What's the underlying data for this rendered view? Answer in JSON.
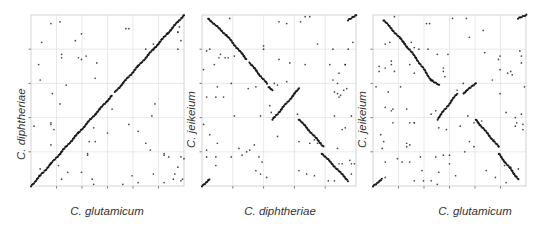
{
  "chart_data": [
    {
      "type": "scatter",
      "subtype": "dot-plot (genome synteny)",
      "title": "",
      "xlabel": "C. glutamicum",
      "ylabel": "C. diphtheriae",
      "xlim": [
        0,
        1
      ],
      "ylim": [
        0,
        1
      ],
      "grid": true,
      "x_ticks": 6,
      "y_ticks": 4,
      "tick_labels_visible": false,
      "segments": [
        [
          0.0,
          0.0,
          0.06,
          0.06
        ],
        [
          0.06,
          0.06,
          0.13,
          0.13
        ],
        [
          0.13,
          0.13,
          0.19,
          0.19
        ],
        [
          0.19,
          0.19,
          0.31,
          0.31
        ],
        [
          0.31,
          0.31,
          0.42,
          0.42
        ],
        [
          0.42,
          0.42,
          0.53,
          0.53
        ],
        [
          0.55,
          0.55,
          0.7,
          0.7
        ],
        [
          0.7,
          0.7,
          0.8,
          0.8
        ],
        [
          0.8,
          0.8,
          0.89,
          0.89
        ],
        [
          0.89,
          0.89,
          0.96,
          0.96
        ],
        [
          0.96,
          0.96,
          1.0,
          1.0
        ]
      ],
      "points": [
        [
          0.13,
          0.95
        ],
        [
          0.19,
          0.96
        ],
        [
          0.07,
          0.84
        ],
        [
          0.33,
          0.89
        ],
        [
          0.29,
          0.85
        ],
        [
          0.05,
          0.71
        ],
        [
          0.06,
          0.62
        ],
        [
          0.14,
          0.54
        ],
        [
          0.19,
          0.48
        ],
        [
          0.2,
          0.77
        ],
        [
          0.2,
          0.75
        ],
        [
          0.23,
          0.59
        ],
        [
          0.31,
          0.75
        ],
        [
          0.33,
          0.74
        ],
        [
          0.36,
          0.76
        ],
        [
          0.43,
          0.72
        ],
        [
          0.42,
          0.63
        ],
        [
          0.53,
          0.45
        ],
        [
          0.5,
          0.31
        ],
        [
          0.02,
          0.35
        ],
        [
          0.13,
          0.37
        ],
        [
          0.13,
          0.36
        ],
        [
          0.13,
          0.24
        ],
        [
          0.15,
          0.33
        ],
        [
          0.41,
          0.34
        ],
        [
          0.38,
          0.26
        ],
        [
          0.42,
          0.26
        ],
        [
          0.37,
          0.18
        ],
        [
          0.37,
          0.19
        ],
        [
          0.18,
          0.12
        ],
        [
          0.24,
          0.08
        ],
        [
          0.33,
          0.08
        ],
        [
          0.4,
          0.04
        ],
        [
          0.41,
          0.01
        ],
        [
          0.2,
          0.04
        ],
        [
          0.06,
          0.1
        ],
        [
          0.62,
          0.92
        ],
        [
          0.64,
          0.92
        ],
        [
          0.64,
          0.36
        ],
        [
          0.7,
          0.32
        ],
        [
          0.75,
          0.25
        ],
        [
          0.78,
          0.21
        ],
        [
          0.81,
          0.48
        ],
        [
          0.79,
          0.41
        ],
        [
          0.75,
          0.8
        ],
        [
          0.8,
          0.83
        ],
        [
          0.87,
          0.19
        ],
        [
          0.87,
          0.18
        ],
        [
          0.9,
          0.17
        ],
        [
          0.93,
          0.04
        ],
        [
          0.94,
          0.07
        ],
        [
          0.96,
          0.11
        ],
        [
          0.98,
          0.03
        ],
        [
          0.99,
          0.04
        ],
        [
          0.98,
          0.17
        ],
        [
          1.0,
          0.16
        ],
        [
          0.97,
          0.93
        ],
        [
          0.98,
          0.85
        ],
        [
          0.96,
          0.9
        ],
        [
          0.96,
          0.8
        ],
        [
          0.96,
          0.9
        ],
        [
          0.66,
          0.06
        ],
        [
          0.6,
          0.01
        ],
        [
          0.8,
          0.07
        ],
        [
          0.87,
          0.02
        ],
        [
          0.7,
          0.02
        ]
      ]
    },
    {
      "type": "scatter",
      "subtype": "dot-plot (genome synteny)",
      "title": "",
      "xlabel": "C. diphtheriae",
      "ylabel": "C. jeikeium",
      "xlim": [
        0,
        1
      ],
      "ylim": [
        0,
        1
      ],
      "grid": true,
      "x_ticks": 5,
      "y_ticks": 4,
      "tick_labels_visible": false,
      "segments": [
        [
          0.04,
          0.98,
          0.16,
          0.88
        ],
        [
          0.16,
          0.88,
          0.29,
          0.74
        ],
        [
          0.31,
          0.72,
          0.42,
          0.6
        ],
        [
          0.43,
          0.58,
          0.46,
          0.56
        ],
        [
          0.46,
          0.39,
          0.63,
          0.57
        ],
        [
          0.63,
          0.39,
          0.79,
          0.23
        ],
        [
          0.78,
          0.19,
          0.95,
          0.03
        ],
        [
          0.0,
          0.0,
          0.05,
          0.04
        ],
        [
          0.95,
          0.97,
          1.0,
          1.0
        ]
      ],
      "points": [
        [
          0.18,
          0.98
        ],
        [
          0.5,
          0.96
        ],
        [
          0.55,
          0.95
        ],
        [
          0.67,
          0.99
        ],
        [
          0.7,
          0.99
        ],
        [
          0.4,
          0.82
        ],
        [
          0.4,
          0.8
        ],
        [
          0.5,
          0.74
        ],
        [
          0.05,
          0.8
        ],
        [
          0.03,
          0.79
        ],
        [
          0.12,
          0.77
        ],
        [
          0.17,
          0.75
        ],
        [
          0.21,
          0.76
        ],
        [
          0.11,
          0.75
        ],
        [
          0.08,
          0.71
        ],
        [
          0.57,
          0.72
        ],
        [
          0.67,
          0.71
        ],
        [
          0.83,
          0.71
        ],
        [
          0.93,
          0.71
        ],
        [
          0.01,
          0.68
        ],
        [
          0.15,
          0.75
        ],
        [
          0.75,
          0.83
        ],
        [
          0.85,
          0.8
        ],
        [
          0.95,
          0.8
        ],
        [
          0.98,
          0.84
        ],
        [
          0.93,
          0.71
        ],
        [
          0.89,
          0.66
        ],
        [
          0.1,
          0.58
        ],
        [
          0.19,
          0.6
        ],
        [
          0.47,
          0.6
        ],
        [
          0.49,
          0.59
        ],
        [
          0.35,
          0.58
        ],
        [
          0.55,
          0.61
        ],
        [
          0.85,
          0.62
        ],
        [
          0.88,
          0.6
        ],
        [
          0.03,
          0.52
        ],
        [
          0.09,
          0.52
        ],
        [
          0.14,
          0.52
        ],
        [
          0.94,
          0.57
        ],
        [
          0.92,
          0.56
        ],
        [
          0.86,
          0.55
        ],
        [
          0.9,
          0.53
        ],
        [
          0.89,
          0.52
        ],
        [
          0.88,
          0.54
        ],
        [
          0.44,
          0.47
        ],
        [
          0.45,
          0.43
        ],
        [
          0.21,
          0.41
        ],
        [
          0.38,
          0.41
        ],
        [
          0.62,
          0.42
        ],
        [
          0.86,
          0.41
        ],
        [
          0.97,
          0.41
        ],
        [
          0.01,
          0.36
        ],
        [
          0.05,
          0.3
        ],
        [
          0.1,
          0.25
        ],
        [
          0.49,
          0.29
        ],
        [
          0.91,
          0.33
        ],
        [
          0.93,
          0.34
        ],
        [
          0.63,
          0.26
        ],
        [
          0.7,
          0.25
        ],
        [
          0.73,
          0.27
        ],
        [
          0.75,
          0.25
        ],
        [
          0.88,
          0.22
        ],
        [
          0.89,
          0.13
        ],
        [
          0.91,
          0.13
        ],
        [
          0.97,
          0.13
        ],
        [
          0.99,
          0.13
        ],
        [
          0.96,
          0.15
        ],
        [
          0.03,
          0.17
        ],
        [
          0.03,
          0.21
        ],
        [
          0.09,
          0.17
        ],
        [
          0.19,
          0.17
        ],
        [
          0.24,
          0.22
        ],
        [
          0.26,
          0.18
        ],
        [
          0.29,
          0.2
        ],
        [
          0.31,
          0.21
        ],
        [
          0.34,
          0.24
        ],
        [
          0.37,
          0.17
        ],
        [
          0.39,
          0.14
        ],
        [
          0.35,
          0.09
        ],
        [
          0.38,
          0.07
        ],
        [
          0.42,
          0.05
        ],
        [
          0.09,
          0.12
        ],
        [
          0.63,
          0.09
        ],
        [
          0.68,
          0.07
        ],
        [
          0.73,
          0.06
        ],
        [
          0.82,
          0.03
        ],
        [
          0.86,
          0.03
        ],
        [
          0.97,
          0.07
        ],
        [
          0.64,
          0.96
        ],
        [
          0.3,
          0.57
        ]
      ]
    },
    {
      "type": "scatter",
      "subtype": "dot-plot (genome synteny)",
      "title": "",
      "xlabel": "C. glutamicum",
      "ylabel": "C. jeikeium",
      "xlim": [
        0,
        1
      ],
      "ylim": [
        0,
        1
      ],
      "grid": true,
      "x_ticks": 6,
      "y_ticks": 4,
      "tick_labels_visible": false,
      "segments": [
        [
          0.07,
          0.97,
          0.2,
          0.84
        ],
        [
          0.2,
          0.84,
          0.28,
          0.75
        ],
        [
          0.28,
          0.75,
          0.38,
          0.62
        ],
        [
          0.38,
          0.62,
          0.43,
          0.59
        ],
        [
          0.42,
          0.39,
          0.55,
          0.54
        ],
        [
          0.59,
          0.54,
          0.67,
          0.6
        ],
        [
          0.67,
          0.39,
          0.82,
          0.23
        ],
        [
          0.82,
          0.19,
          0.95,
          0.04
        ],
        [
          0.0,
          0.0,
          0.06,
          0.04
        ],
        [
          0.95,
          0.98,
          1.0,
          1.0
        ]
      ],
      "points": [
        [
          0.14,
          0.99
        ],
        [
          0.35,
          0.95
        ],
        [
          0.37,
          0.95
        ],
        [
          0.52,
          0.98
        ],
        [
          0.61,
          0.98
        ],
        [
          0.63,
          0.87
        ],
        [
          0.72,
          0.91
        ],
        [
          0.08,
          0.83
        ],
        [
          0.11,
          0.84
        ],
        [
          0.18,
          0.87
        ],
        [
          0.25,
          0.84
        ],
        [
          0.22,
          0.81
        ],
        [
          0.27,
          0.81
        ],
        [
          0.3,
          0.8
        ],
        [
          0.36,
          0.8
        ],
        [
          0.42,
          0.77
        ],
        [
          0.49,
          0.77
        ],
        [
          0.73,
          0.78
        ],
        [
          0.82,
          0.74
        ],
        [
          0.83,
          0.76
        ],
        [
          0.96,
          0.79
        ],
        [
          0.97,
          0.76
        ],
        [
          0.97,
          0.72
        ],
        [
          0.04,
          0.7
        ],
        [
          0.08,
          0.69
        ],
        [
          0.04,
          0.67
        ],
        [
          0.12,
          0.73
        ],
        [
          0.12,
          0.71
        ],
        [
          0.14,
          0.67
        ],
        [
          0.24,
          0.71
        ],
        [
          0.27,
          0.66
        ],
        [
          0.46,
          0.69
        ],
        [
          0.46,
          0.67
        ],
        [
          0.83,
          0.68
        ],
        [
          0.88,
          0.66
        ],
        [
          0.9,
          0.67
        ],
        [
          0.91,
          0.65
        ],
        [
          0.02,
          0.58
        ],
        [
          0.1,
          0.55
        ],
        [
          0.18,
          0.58
        ],
        [
          0.35,
          0.66
        ],
        [
          0.39,
          0.62
        ],
        [
          0.47,
          0.64
        ],
        [
          0.59,
          0.6
        ],
        [
          0.55,
          0.56
        ],
        [
          0.78,
          0.62
        ],
        [
          0.83,
          0.54
        ],
        [
          0.99,
          0.58
        ],
        [
          0.13,
          0.45
        ],
        [
          0.12,
          0.44
        ],
        [
          0.22,
          0.45
        ],
        [
          0.08,
          0.46
        ],
        [
          0.13,
          0.37
        ],
        [
          0.24,
          0.37
        ],
        [
          0.27,
          0.37
        ],
        [
          0.05,
          0.3
        ],
        [
          0.07,
          0.26
        ],
        [
          0.06,
          0.22
        ],
        [
          0.08,
          0.14
        ],
        [
          0.16,
          0.16
        ],
        [
          0.22,
          0.25
        ],
        [
          0.24,
          0.24
        ],
        [
          0.22,
          0.23
        ],
        [
          0.27,
          0.37
        ],
        [
          0.31,
          0.17
        ],
        [
          0.41,
          0.17
        ],
        [
          0.43,
          0.34
        ],
        [
          0.38,
          0.42
        ],
        [
          0.41,
          0.44
        ],
        [
          0.48,
          0.33
        ],
        [
          0.5,
          0.18
        ],
        [
          0.57,
          0.35
        ],
        [
          0.62,
          0.41
        ],
        [
          0.66,
          0.37
        ],
        [
          0.71,
          0.38
        ],
        [
          0.79,
          0.27
        ],
        [
          0.87,
          0.43
        ],
        [
          0.93,
          0.35
        ],
        [
          0.94,
          0.37
        ],
        [
          0.98,
          0.33
        ],
        [
          0.97,
          0.42
        ],
        [
          0.93,
          0.4
        ],
        [
          0.98,
          0.36
        ],
        [
          0.6,
          0.2
        ],
        [
          0.63,
          0.26
        ],
        [
          0.66,
          0.23
        ],
        [
          0.5,
          0.13
        ],
        [
          0.43,
          0.08
        ],
        [
          0.42,
          0.01
        ],
        [
          0.32,
          0.09
        ],
        [
          0.24,
          0.14
        ],
        [
          0.08,
          0.05
        ],
        [
          0.19,
          0.14
        ],
        [
          0.27,
          0.03
        ],
        [
          0.33,
          0.03
        ],
        [
          0.38,
          0.03
        ],
        [
          0.46,
          0.18
        ],
        [
          0.54,
          0.06
        ],
        [
          0.74,
          0.09
        ],
        [
          0.8,
          0.05
        ],
        [
          0.9,
          0.11
        ],
        [
          0.86,
          0.12
        ],
        [
          0.95,
          0.1
        ],
        [
          0.87,
          0.02
        ],
        [
          0.92,
          0.07
        ]
      ]
    }
  ],
  "labels": {
    "p1_x": "C. glutamicum",
    "p1_y": "C. diphtheriae",
    "p2_x": "C. diphtheriae",
    "p2_y": "C. jeikeium",
    "p3_x": "C. glutamicum",
    "p3_y": "C. jeikeium"
  },
  "colors": {
    "dot": "#1a1a1a",
    "grid": "#e3e3e3",
    "frame": "#c8c8c8",
    "tick": "#555555",
    "label": "#333333"
  }
}
